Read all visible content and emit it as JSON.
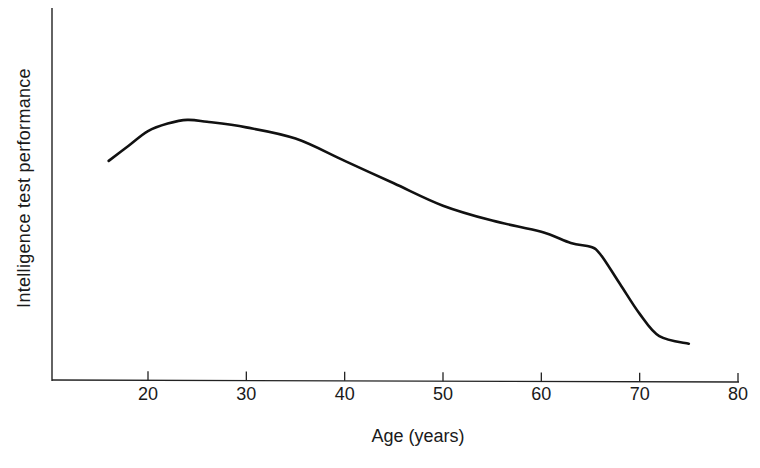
{
  "chart_data": {
    "type": "line",
    "title": "",
    "xlabel": "Age (years)",
    "ylabel": "Intelligence test performance",
    "xlim": [
      10,
      80
    ],
    "ylim": [
      0,
      100
    ],
    "x_ticks": [
      20,
      30,
      40,
      50,
      60,
      70,
      80
    ],
    "y_ticks": [],
    "grid": false,
    "legend": null,
    "y_units_note": "Y axis unlabeled; values on arbitrary 0-100 scale estimated from pixel height",
    "series": [
      {
        "name": "Intelligence test performance",
        "x": [
          16,
          18,
          20,
          22,
          24,
          26,
          30,
          35,
          40,
          45,
          50,
          55,
          60,
          63,
          65,
          66,
          68,
          70,
          72,
          75
        ],
        "y": [
          59,
          63,
          67,
          69,
          70,
          69.5,
          68,
          65,
          59,
          53,
          47,
          43,
          40,
          37,
          36,
          34,
          26,
          18,
          12,
          10
        ]
      }
    ]
  },
  "axes": {
    "x_label": "Age (years)",
    "y_label": "Intelligence test performance",
    "x_tick_labels": [
      "20",
      "30",
      "40",
      "50",
      "60",
      "70",
      "80"
    ]
  }
}
